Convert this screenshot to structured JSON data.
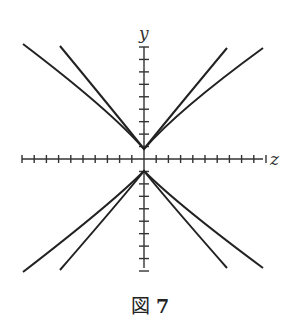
{
  "figure": {
    "caption_prefix": "図",
    "caption_number": "7",
    "x_axis_label": "z",
    "y_axis_label": "y"
  },
  "chart_data": {
    "type": "line",
    "title": "図 7",
    "xlabel": "z",
    "ylabel": "y",
    "grid": false,
    "axis_ticks": {
      "x_ticks_each_side": 10,
      "y_ticks_each_side": 9
    },
    "series": [
      {
        "name": "upper-wide",
        "points": [
          [
            -10.5,
            9.5
          ],
          [
            -5,
            5
          ],
          [
            0,
            0.8
          ],
          [
            5,
            5
          ],
          [
            10.5,
            9.5
          ]
        ]
      },
      {
        "name": "upper-narrow",
        "points": [
          [
            -7.3,
            9.4
          ],
          [
            -3.5,
            5
          ],
          [
            0,
            0.8
          ],
          [
            3.5,
            5
          ],
          [
            7.3,
            9.4
          ]
        ]
      },
      {
        "name": "lower-wide",
        "points": [
          [
            -10.5,
            -9.8
          ],
          [
            -5,
            -5.2
          ],
          [
            0,
            -1
          ],
          [
            5,
            -5.2
          ],
          [
            10.5,
            -9.8
          ]
        ]
      },
      {
        "name": "lower-narrow",
        "points": [
          [
            -7.3,
            -9.6
          ],
          [
            -3.5,
            -5.2
          ],
          [
            0,
            -1
          ],
          [
            3.5,
            -5.2
          ],
          [
            7.3,
            -9.6
          ]
        ]
      }
    ]
  }
}
